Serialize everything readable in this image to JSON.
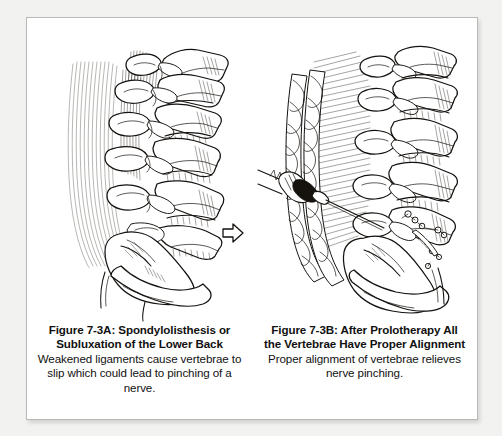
{
  "figure": {
    "panels": [
      {
        "id": "panel-a",
        "illustration_name": "lumbar-spine-misaligned-lateral-view",
        "annotation_icon": "slippage-arrow-icon",
        "caption_title": "Figure 7-3A: Spondylolisthesis or Subluxation of the Lower Back",
        "caption_body": "Weakened ligaments cause vertebrae to slip which could lead to pinching of a nerve."
      },
      {
        "id": "panel-b",
        "illustration_name": "lumbar-spine-aligned-lateral-view-with-injection",
        "annotation_icon": "syringe-icon",
        "caption_title": "Figure 7-3B: After Prolotherapy All the Vertebrae Have Proper Alignment",
        "caption_body": "Proper alignment of vertebrae relieves nerve pinching."
      }
    ],
    "colors": {
      "ink": "#15120f",
      "paper": "#ffffff",
      "page_background": "#f2f2f0",
      "frame_border": "#b9b9b7"
    }
  }
}
